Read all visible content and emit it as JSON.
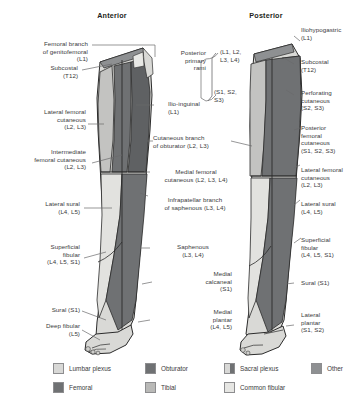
{
  "figure": {
    "type": "anatomical-diagram",
    "views": {
      "anterior_title": "Anterior",
      "posterior_title": "Posterior"
    }
  },
  "labels_left": [
    {
      "id": "femoral-branch-genitofemoral",
      "lines": [
        "Femoral branch",
        "of genitofemoral",
        "(L1)"
      ]
    },
    {
      "id": "subcostal-anterior",
      "lines": [
        "Subcostal",
        "(T12)"
      ]
    },
    {
      "id": "lateral-femoral-cutaneous-anterior",
      "lines": [
        "Lateral femoral",
        "cutaneous",
        "(L2, L3)"
      ]
    },
    {
      "id": "intermediate-femoral-cutaneous",
      "lines": [
        "Intermediate",
        "femoral cutaneous",
        "(L2, L3)"
      ]
    },
    {
      "id": "lateral-sural-anterior",
      "lines": [
        "Lateral sural",
        "(L4, L5)"
      ]
    },
    {
      "id": "superficial-fibular-anterior",
      "lines": [
        "Superficial",
        "fibular",
        "(L4, L5, S1)"
      ]
    },
    {
      "id": "sural-anterior",
      "lines": [
        "Sural (S1)"
      ]
    },
    {
      "id": "deep-fibular",
      "lines": [
        "Deep fibular",
        "(L5)"
      ]
    }
  ],
  "labels_center": [
    {
      "id": "posterior-primary-rami",
      "lines": [
        "Posterior",
        "primary",
        "rami"
      ]
    },
    {
      "id": "posterior-primary-rami-upper-roots",
      "lines": [
        "(L1, L2,",
        "L3, L4)"
      ]
    },
    {
      "id": "posterior-primary-rami-lower-roots",
      "lines": [
        "(S1, S2,",
        "S3)"
      ]
    },
    {
      "id": "ilio-inguinal",
      "lines": [
        "Ilio-inguinal",
        "(L1)"
      ]
    },
    {
      "id": "cutaneous-branch-obturator",
      "lines": [
        "Cutaneous branch",
        "of obturator (L2, L3)"
      ]
    },
    {
      "id": "medial-femoral-cutaneous",
      "lines": [
        "Medial femoral",
        "cutaneous (L2, L3, L4)"
      ]
    },
    {
      "id": "infrapatellar-branch-saphenous",
      "lines": [
        "Infrapatellar branch",
        "of saphenous (L3, L4)"
      ]
    },
    {
      "id": "saphenous",
      "lines": [
        "Saphenous",
        "(L3, L4)"
      ]
    },
    {
      "id": "medial-calcaneal",
      "lines": [
        "Medial",
        "calcaneal",
        "(S1)"
      ]
    },
    {
      "id": "medial-plantar",
      "lines": [
        "Medial",
        "plantar",
        "(L4, L5)"
      ]
    }
  ],
  "labels_right": [
    {
      "id": "iliohypogastric",
      "lines": [
        "Iliohypogastric",
        "(L1)"
      ]
    },
    {
      "id": "subcostal-posterior",
      "lines": [
        "Subcostal",
        "(T12)"
      ]
    },
    {
      "id": "perforating-cutaneous",
      "lines": [
        "Perforating",
        "cutaneous",
        "(S2, S3)"
      ]
    },
    {
      "id": "posterior-femoral-cutaneous",
      "lines": [
        "Posterior",
        "femoral",
        "cutaneous",
        "(S1, S2, S3)"
      ]
    },
    {
      "id": "lateral-femoral-cutaneous-posterior",
      "lines": [
        "Lateral femoral",
        "cutaneous",
        "(L2, L3)"
      ]
    },
    {
      "id": "lateral-sural-posterior",
      "lines": [
        "Lateral sural",
        "(L4, L5)"
      ]
    },
    {
      "id": "superficial-fibular-posterior",
      "lines": [
        "Superficial",
        "fibular",
        "(L4, L5, S1)"
      ]
    },
    {
      "id": "sural-posterior",
      "lines": [
        "Sural (S1)"
      ]
    },
    {
      "id": "lateral-plantar",
      "lines": [
        "Lateral",
        "plantar",
        "(S1, S2)"
      ]
    }
  ],
  "legend": {
    "items": [
      {
        "id": "lumbar-plexus",
        "label": "Lumbar plexus",
        "color": "#d8d8d6",
        "split": false
      },
      {
        "id": "obturator",
        "label": "Obturator",
        "color": "#6f7173",
        "split": false
      },
      {
        "id": "sacral-plexus",
        "label": "Sacral plexus",
        "color": "#d8d8d6",
        "split": true
      },
      {
        "id": "other",
        "label": "Other",
        "color": "#8e9092",
        "split": false
      },
      {
        "id": "femoral",
        "label": "Femoral",
        "color": "#6f7173",
        "split": false
      },
      {
        "id": "tibial",
        "label": "Tibial",
        "color": "#b9b9b7",
        "split": false
      },
      {
        "id": "common-fibular",
        "label": "Common fibular",
        "color": "#e6e6e3",
        "split": false
      }
    ]
  },
  "colors": {
    "light": "#d9d9d6",
    "lighter": "#e8e8e5",
    "mid": "#b9b9b7",
    "dark": "#6f7173",
    "darker": "#56585a",
    "outline": "#2b2b2b",
    "text": "#3a3a3c",
    "leader": "#6a6a6c"
  }
}
